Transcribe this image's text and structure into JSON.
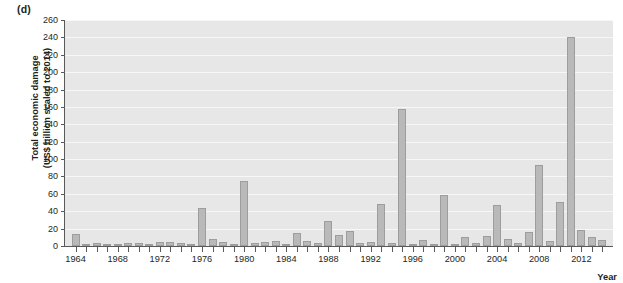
{
  "panel": {
    "label": "(d)"
  },
  "chart_data": {
    "type": "bar",
    "title": "",
    "panel_label": "(d)",
    "xlabel": "Year",
    "ylabel": "Total economic damage (US$ billion scaled to 2014)",
    "ylabel_line1": "Total economic damage",
    "ylabel_line2": "(US$ billion scaled to 2014)",
    "ylim": [
      0,
      260
    ],
    "ytick_values": [
      0,
      20,
      40,
      60,
      80,
      100,
      120,
      140,
      160,
      180,
      200,
      220,
      240,
      260
    ],
    "ytick_labels": [
      "0",
      "20",
      "40",
      "60",
      "80",
      "100",
      "120",
      "140",
      "160",
      "180",
      "200",
      "220",
      "240",
      "260"
    ],
    "xlim": [
      1963,
      2015
    ],
    "xtick_labels": [
      "1964",
      "1968",
      "1972",
      "1976",
      "1980",
      "1984",
      "1988",
      "1992",
      "1996",
      "2000",
      "2004",
      "2008",
      "2012"
    ],
    "xtick_values": [
      1964,
      1968,
      1972,
      1976,
      1980,
      1984,
      1988,
      1992,
      1996,
      2000,
      2004,
      2008,
      2012
    ],
    "grid": true,
    "grid_color": "#f7f7f7",
    "plot_background": "#e7e7e7",
    "bar_color": "#b9b9b9",
    "bar_edge_color": "#9d9d9d",
    "axis_color": "#58595b",
    "legend": null,
    "categories": [
      1964,
      1965,
      1966,
      1967,
      1968,
      1969,
      1970,
      1971,
      1972,
      1973,
      1974,
      1975,
      1976,
      1977,
      1978,
      1979,
      1980,
      1981,
      1982,
      1983,
      1984,
      1985,
      1986,
      1987,
      1988,
      1989,
      1990,
      1991,
      1992,
      1993,
      1994,
      1995,
      1996,
      1997,
      1998,
      1999,
      2000,
      2001,
      2002,
      2003,
      2004,
      2005,
      2006,
      2007,
      2008,
      2009,
      2010,
      2011,
      2012,
      2013,
      2014
    ],
    "values": [
      14,
      1.5,
      3,
      0.8,
      0.5,
      4,
      3.5,
      0.5,
      5,
      5,
      4,
      0.5,
      44,
      8,
      4.5,
      1.5,
      75,
      3,
      5,
      6,
      0.8,
      15,
      6,
      4,
      29,
      13,
      17,
      3,
      4.5,
      48,
      3,
      158,
      1,
      7,
      2,
      59,
      0.8,
      10,
      3,
      11,
      47,
      8,
      4,
      16.5,
      93,
      5.5,
      50.5,
      241,
      18,
      10,
      7
    ]
  }
}
